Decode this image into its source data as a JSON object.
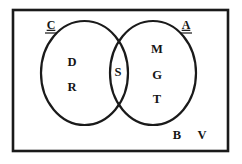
{
  "diagram": {
    "type": "venn-diagram",
    "universe": {
      "name": "universal-set-rectangle",
      "x": 13,
      "y": 10,
      "width": 215,
      "height": 141
    },
    "sets": [
      {
        "id": "left",
        "label": "C",
        "label_underlined": true,
        "label_x": 51,
        "label_y": 26,
        "cx": 84.5,
        "cy": 73,
        "rx": 43.5,
        "ry": 52
      },
      {
        "id": "right",
        "label": "A",
        "label_underlined": true,
        "label_x": 186,
        "label_y": 26,
        "cx": 153,
        "cy": 73,
        "rx": 43,
        "ry": 52
      }
    ],
    "regions": [
      {
        "name": "left-only",
        "set": "C",
        "members": [
          {
            "text": "D",
            "x": 72,
            "y": 63
          },
          {
            "text": "R",
            "x": 72,
            "y": 88
          }
        ]
      },
      {
        "name": "intersection",
        "set": "C and A",
        "members": [
          {
            "text": "S",
            "x": 118,
            "y": 73
          }
        ]
      },
      {
        "name": "right-only",
        "set": "A",
        "members": [
          {
            "text": "M",
            "x": 157,
            "y": 50
          },
          {
            "text": "G",
            "x": 157,
            "y": 76
          },
          {
            "text": "T",
            "x": 157,
            "y": 100
          }
        ]
      },
      {
        "name": "outside-both",
        "set": "universe only",
        "members": [
          {
            "text": "B",
            "x": 177,
            "y": 136
          },
          {
            "text": "V",
            "x": 202,
            "y": 136
          }
        ]
      }
    ],
    "colors": {
      "stroke": "#1a1a1a",
      "text": "#151515",
      "background": "#ffffff"
    }
  }
}
